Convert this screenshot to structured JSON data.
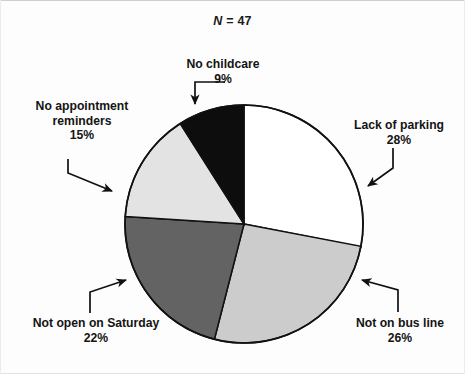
{
  "chart_data": {
    "type": "pie",
    "title_prefix_italic": "N",
    "title_value": "= 47",
    "sample_size": 47,
    "xlabel": "",
    "ylabel": "",
    "legend_position": "none",
    "grid": false,
    "start_angle_deg": 0,
    "direction": "clockwise",
    "categories": [
      "Lack of parking",
      "Not on bus line",
      "Not open on Saturday",
      "No appointment reminders",
      "No childcare"
    ],
    "values": [
      28,
      26,
      22,
      15,
      9
    ],
    "value_labels": [
      "28%",
      "26%",
      "22%",
      "15%",
      "9%"
    ],
    "colors": [
      "#ffffff",
      "#cccccc",
      "#636363",
      "#e3e3e3",
      "#0d0d0d"
    ],
    "slice_border_color": "#111111",
    "slices": [
      {
        "label": "Lack of parking",
        "percent": 28,
        "percent_label": "28%",
        "color": "#ffffff"
      },
      {
        "label": "Not on bus line",
        "percent": 26,
        "percent_label": "26%",
        "color": "#cccccc"
      },
      {
        "label": "Not open on Saturday",
        "percent": 22,
        "percent_label": "22%",
        "color": "#636363"
      },
      {
        "label": "No appointment reminders",
        "percent": 15,
        "percent_label": "15%",
        "color": "#e3e3e3"
      },
      {
        "label": "No childcare",
        "percent": 9,
        "percent_label": "9%",
        "color": "#0d0d0d"
      }
    ]
  },
  "labels": {
    "no_childcare": {
      "name": "No childcare",
      "percent": "9%"
    },
    "lack_of_parking": {
      "name": "Lack of parking",
      "percent": "28%"
    },
    "no_appointment_reminders": {
      "name_line1": "No appointment",
      "name_line2": "reminders",
      "percent": "15%"
    },
    "not_open_on_saturday": {
      "name": "Not open on Saturday",
      "percent": "22%"
    },
    "not_on_bus_line": {
      "name": "Not on bus line",
      "percent": "26%"
    }
  },
  "annotations": {
    "leader_color": "#111111"
  }
}
